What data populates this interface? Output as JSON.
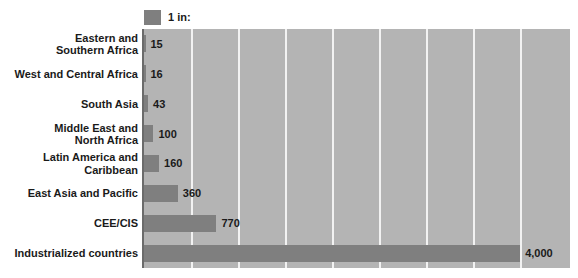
{
  "legend": {
    "swatch_name": "legend-swatch",
    "label": "1 in:",
    "color": "#7f7f7f"
  },
  "colors": {
    "bar": "#7f7f7f",
    "plot_background": "#b4b4b4",
    "gridline": "#f2f2f2",
    "axis": "#6b6b6b",
    "text": "#1a1a1a",
    "page_background": "#ffffff"
  },
  "chart_data": {
    "type": "bar",
    "orientation": "horizontal",
    "title": "",
    "subtitle": "",
    "xlabel": "",
    "ylabel": "",
    "legend_entries": [
      "1 in:"
    ],
    "legend_position": "top-left",
    "grid": true,
    "gridline_values": [
      500,
      1000,
      1500,
      2000,
      2500,
      3000,
      3500,
      4000
    ],
    "xlim": [
      0,
      4530
    ],
    "categories": [
      "Eastern and\nSouthern Africa",
      "West and Central Africa",
      "South Asia",
      "Middle East and\nNorth Africa",
      "Latin America and\nCaribbean",
      "East Asia and Pacific",
      "CEE/CIS",
      "Industrialized countries"
    ],
    "values": [
      15,
      16,
      43,
      100,
      160,
      360,
      770,
      4000
    ],
    "value_labels": [
      "15",
      "16",
      "43",
      "100",
      "160",
      "360",
      "770",
      "4,000"
    ]
  }
}
